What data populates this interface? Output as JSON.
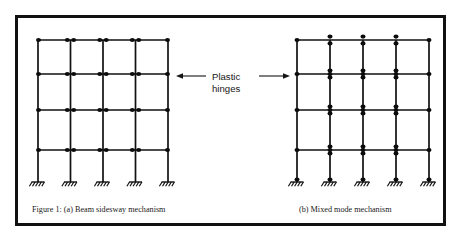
{
  "figure": {
    "border_color": "#111111",
    "background": "#ffffff",
    "line_color": "#111111",
    "hinge_color": "#0c0c0c",
    "captions": {
      "left": "Figure 1: (a) Beam sidesway mechanism",
      "right": "(b) Mixed mode mechanism"
    },
    "annotation": {
      "line1": "Plastic",
      "line2": "hinges",
      "arrow_left_label": "arrow-pointing-left",
      "arrow_right_label": "arrow-pointing-right"
    },
    "frames": [
      {
        "id": "left-frame",
        "name": "beam-sidesway-mechanism",
        "columns_x": [
          38,
          70.5,
          103,
          135.5,
          168
        ],
        "beams_y": [
          40,
          74,
          110,
          150
        ],
        "base_y": 182,
        "hinge_style": "beam-ends-horizontal-pairs",
        "base_hinges": false,
        "supports": 5
      },
      {
        "id": "right-frame",
        "name": "mixed-mode-mechanism",
        "columns_x": [
          297,
          330,
          363,
          396,
          429
        ],
        "beams_y": [
          40,
          74,
          110,
          150
        ],
        "base_y": 182,
        "hinge_style": "joint-vertical-pairs-and-column-bases",
        "base_hinges": true,
        "supports": 5
      }
    ]
  }
}
